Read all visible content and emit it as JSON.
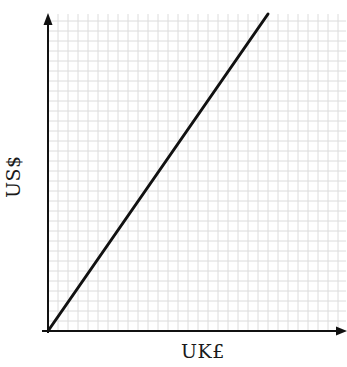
{
  "chart_data": {
    "type": "line",
    "title": "",
    "xlabel": "UK£",
    "ylabel": "US$",
    "grid": true,
    "grid_style": "graph-paper, light grey squares",
    "axis_arrows": true,
    "ticks": "none",
    "legend": "none",
    "xlim": [
      0,
      30
    ],
    "ylim": [
      0,
      32
    ],
    "series": [
      {
        "name": "exchange-rate-line",
        "x": [
          0,
          22
        ],
        "y": [
          0,
          31.7
        ],
        "color": "#111111"
      }
    ]
  },
  "colors": {
    "axis": "#111111",
    "grid": "#dcdcdc",
    "line": "#111111",
    "background": "#ffffff"
  }
}
